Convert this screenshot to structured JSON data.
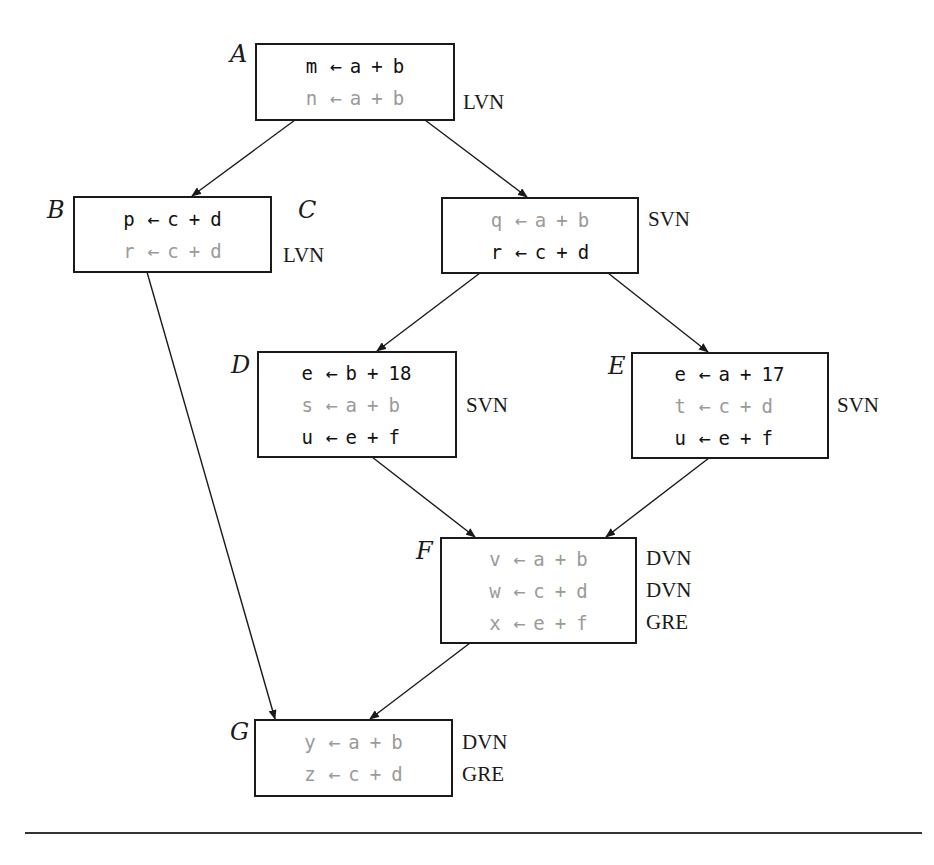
{
  "figure": {
    "colors": {
      "active_text": "#111111",
      "eliminated_text": "#9a9a9a",
      "stroke": "#1a1a1a"
    },
    "blocks": {
      "A": {
        "label": "A",
        "statements": [
          {
            "lhs": "m",
            "arrow": "←",
            "left": "a",
            "op": "+",
            "right": "b",
            "eliminated": false
          },
          {
            "lhs": "n",
            "arrow": "←",
            "left": "a",
            "op": "+",
            "right": "b",
            "eliminated": true
          }
        ],
        "tags": [
          "",
          "LVN"
        ]
      },
      "B": {
        "label": "B",
        "statements": [
          {
            "lhs": "p",
            "arrow": "←",
            "left": "c",
            "op": "+",
            "right": "d",
            "eliminated": false
          },
          {
            "lhs": "r",
            "arrow": "←",
            "left": "c",
            "op": "+",
            "right": "d",
            "eliminated": true
          }
        ],
        "tags": [
          "",
          "LVN"
        ]
      },
      "C": {
        "label": "C",
        "statements": [
          {
            "lhs": "q",
            "arrow": "←",
            "left": "a",
            "op": "+",
            "right": "b",
            "eliminated": true
          },
          {
            "lhs": "r",
            "arrow": "←",
            "left": "c",
            "op": "+",
            "right": "d",
            "eliminated": false
          }
        ],
        "tags": [
          "SVN",
          ""
        ]
      },
      "D": {
        "label": "D",
        "statements": [
          {
            "lhs": "e",
            "arrow": "←",
            "left": "b",
            "op": "+",
            "right": "18",
            "eliminated": false
          },
          {
            "lhs": "s",
            "arrow": "←",
            "left": "a",
            "op": "+",
            "right": "b",
            "eliminated": true
          },
          {
            "lhs": "u",
            "arrow": "←",
            "left": "e",
            "op": "+",
            "right": "f",
            "eliminated": false
          }
        ],
        "tags": [
          "",
          "SVN",
          ""
        ]
      },
      "E": {
        "label": "E",
        "statements": [
          {
            "lhs": "e",
            "arrow": "←",
            "left": "a",
            "op": "+",
            "right": "17",
            "eliminated": false
          },
          {
            "lhs": "t",
            "arrow": "←",
            "left": "c",
            "op": "+",
            "right": "d",
            "eliminated": true
          },
          {
            "lhs": "u",
            "arrow": "←",
            "left": "e",
            "op": "+",
            "right": "f",
            "eliminated": false
          }
        ],
        "tags": [
          "",
          "SVN",
          ""
        ]
      },
      "F": {
        "label": "F",
        "statements": [
          {
            "lhs": "v",
            "arrow": "←",
            "left": "a",
            "op": "+",
            "right": "b",
            "eliminated": true
          },
          {
            "lhs": "w",
            "arrow": "←",
            "left": "c",
            "op": "+",
            "right": "d",
            "eliminated": true
          },
          {
            "lhs": "x",
            "arrow": "←",
            "left": "e",
            "op": "+",
            "right": "f",
            "eliminated": true
          }
        ],
        "tags": [
          "DVN",
          "DVN",
          "GRE"
        ]
      },
      "G": {
        "label": "G",
        "statements": [
          {
            "lhs": "y",
            "arrow": "←",
            "left": "a",
            "op": "+",
            "right": "b",
            "eliminated": true
          },
          {
            "lhs": "z",
            "arrow": "←",
            "left": "c",
            "op": "+",
            "right": "d",
            "eliminated": true
          }
        ],
        "tags": [
          "DVN",
          "GRE"
        ]
      }
    },
    "edges": [
      {
        "from": "A",
        "to": "B"
      },
      {
        "from": "A",
        "to": "C"
      },
      {
        "from": "B",
        "to": "G"
      },
      {
        "from": "C",
        "to": "D"
      },
      {
        "from": "C",
        "to": "E"
      },
      {
        "from": "D",
        "to": "F"
      },
      {
        "from": "E",
        "to": "F"
      },
      {
        "from": "F",
        "to": "G"
      }
    ]
  }
}
